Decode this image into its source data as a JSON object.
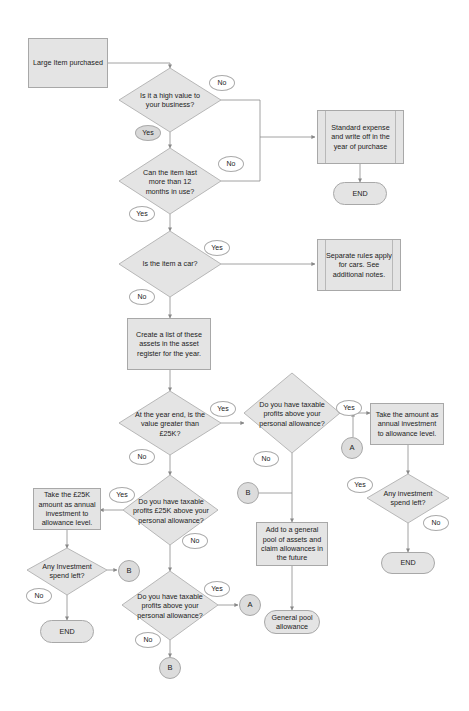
{
  "diagram": {
    "type": "flowchart",
    "colors": {
      "shape_fill": "#e4e4e4",
      "shape_border": "#a8a8a8",
      "connector": "#888888",
      "label_fill": "#ffffff",
      "connector_circle_fill": "#dcdcdc"
    },
    "nodes": {
      "start": "Large Item purchased",
      "q_high_value": "Is it a high value to your business?",
      "q_12_months": "Can the item last more than 12 months in use?",
      "standard_expense": "Standard expense and write off in the year of purchase",
      "end_1": "END",
      "q_car": "Is the item a car?",
      "car_rules": "Separate rules apply for cars. See additional notes.",
      "create_list": "Create a list of these assets in the asset register for the year.",
      "q_over_25k": "At the year end, is the value greater than £25K?",
      "q_profits_right": "Do you have taxable profits above your personal allowance?",
      "take_amount": "Take the amount as annual investment to allowance level.",
      "q_spend_left_right": "Any investment spend left?",
      "end_right": "END",
      "connector_a_right": "A",
      "connector_b_mid": "B",
      "general_pool_add": "Add to a general pool of assets and claim allowances in the future",
      "general_pool": "General pool allowance",
      "q_profits_25k": "Do you have taxable profits £25K above your personal allowance?",
      "take_25k": "Take the £25K amount as annual investment to allowance level.",
      "q_spend_left_left": "Any Investment spend left?",
      "connector_b_left": "B",
      "end_left": "END",
      "q_profits_bottom": "Do you have taxable profits above your personal allowance?",
      "connector_a_bottom": "A",
      "connector_b_bottom": "B"
    },
    "edge_labels": {
      "high_value_no": "No",
      "high_value_yes": "Yes",
      "months_no": "No",
      "months_yes": "Yes",
      "car_yes": "Yes",
      "car_no": "No",
      "over25k_yes": "Yes",
      "over25k_no": "No",
      "profits_right_yes": "Yes",
      "profits_right_no": "No",
      "spend_right_yes": "Yes",
      "spend_right_no": "No",
      "profits25k_yes": "Yes",
      "profits25k_no": "No",
      "spend_left_no": "No",
      "profits_bottom_yes": "Yes",
      "profits_bottom_no": "No"
    }
  }
}
